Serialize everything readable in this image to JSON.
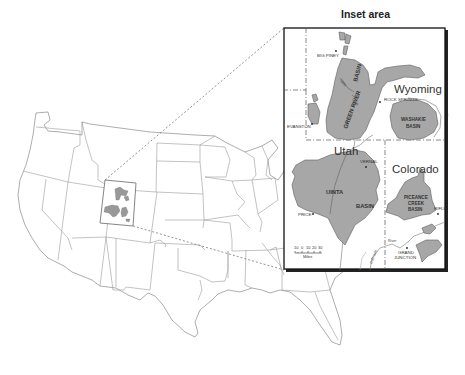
{
  "figure": {
    "inset_title": "Inset area",
    "states": {
      "wyoming": "Wyoming",
      "utah": "Utah",
      "colorado": "Colorado"
    },
    "basins": {
      "green_river_1": "GREEN RIVER",
      "green_river_2": "BASIN",
      "washakie_1": "WASHAKIE",
      "washakie_2": "BASIN",
      "uinta_1": "UINTA",
      "uinta_2": "BASIN",
      "piceance_1": "PICEANCE",
      "piceance_2": "CREEK",
      "piceance_3": "BASIN"
    },
    "uplifts": {
      "uplift_a": "Uplift",
      "uplift_b": "Uplift"
    },
    "cities": {
      "big_piney": "BIG PINEY",
      "rock_springs": "ROCK SPRINGS",
      "evanston": "EVANSTON",
      "vernal": "VERNAL",
      "price": "PRICE",
      "rifle": "RIFLE",
      "grand_junction_1": "GRAND",
      "grand_junction_2": "JUNCTION"
    },
    "rivers": {
      "colorado": "Colorado",
      "river": "River"
    },
    "scale": {
      "ticks": [
        "10",
        "0",
        "10",
        "20",
        "30"
      ],
      "unit": "Miles"
    },
    "colors": {
      "basin_fill": "#a7a7a7",
      "state_line": "#9a9a9a",
      "inset_border": "#111111"
    }
  }
}
